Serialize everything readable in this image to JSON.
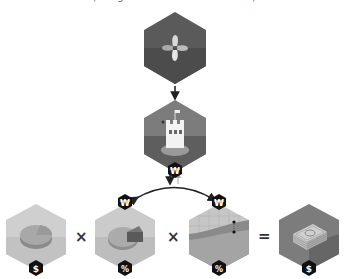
{
  "caption": "(navigation of combined factors)",
  "nodes": {
    "origin": {
      "icon": "flower-logo-icon",
      "fill": "#5a5a5a",
      "lower": "#4c4c4c"
    },
    "castle": {
      "icon": "castle-icon",
      "badge": "₩",
      "fill": "#6a6a6a",
      "lower": "#5c5c5c"
    },
    "value": {
      "icon": "pie-disc-icon",
      "badge": "$",
      "fill": "#c8c8c8",
      "lower": "#bebebe"
    },
    "share": {
      "icon": "pie-slice-icon",
      "badge_top": "₩",
      "badge": "%",
      "fill": "#c4c4c4",
      "lower": "#bababa"
    },
    "trend": {
      "icon": "line-chart-icon",
      "badge_top": "₩",
      "badge": "%",
      "fill": "#b9b9b9",
      "lower": "#9e9e9e"
    },
    "result": {
      "icon": "money-stack-icon",
      "badge": "$",
      "fill": "#7a7a7a",
      "lower": "#6c6c6c"
    }
  },
  "operators": {
    "times_1": "×",
    "times_2": "×",
    "equals": "="
  },
  "arrows": {
    "down": "↓",
    "up": "↑"
  }
}
